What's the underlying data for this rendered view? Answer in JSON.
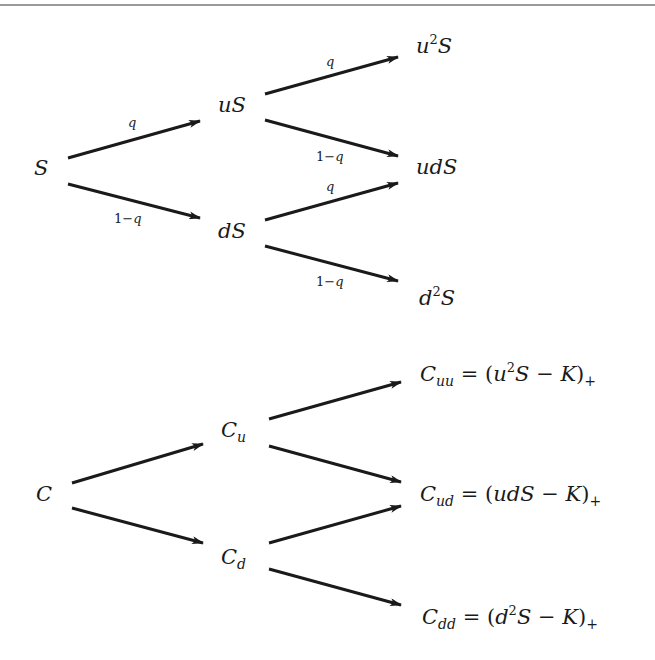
{
  "diagram": {
    "stock_tree": {
      "nodes": {
        "root": {
          "base": "S"
        },
        "up": {
          "base": "uS"
        },
        "down": {
          "base": "dS"
        },
        "upup": {
          "pre": "u",
          "sup": "2",
          "post": "S"
        },
        "updown": {
          "base": "udS"
        },
        "downdown": {
          "pre": "d",
          "sup": "2",
          "post": "S"
        }
      },
      "edge_labels": {
        "up_prob": "q",
        "one": "1",
        "minus": "−",
        "down_prob": "q"
      }
    },
    "option_tree": {
      "nodes": {
        "root": {
          "base": "C"
        },
        "up": {
          "base": "C",
          "sub": "u"
        },
        "down": {
          "base": "C",
          "sub": "d"
        },
        "upup": {
          "base": "C",
          "sub": "uu",
          "eq": " = (",
          "pre": "u",
          "sup": "2",
          "post": "S − K",
          "close": ")",
          "tail_sub": "+"
        },
        "updown": {
          "base": "C",
          "sub": "ud",
          "eq": " = (",
          "expr": "udS − K",
          "close": ")",
          "tail_sub": "+"
        },
        "downdown": {
          "base": "C",
          "sub": "dd",
          "eq": " = (",
          "pre": "d",
          "sup": "2",
          "post": "S − K",
          "close": ")",
          "tail_sub": "+"
        }
      }
    },
    "colors": {
      "ink": "#1a1a1a",
      "rule": "#9a9a9a",
      "background": "#ffffff"
    }
  }
}
